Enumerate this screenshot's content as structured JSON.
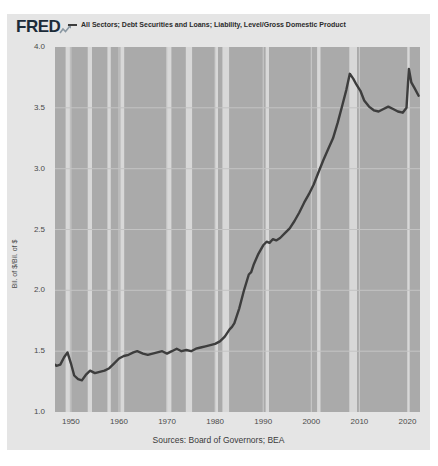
{
  "header": {
    "logo": "FRED",
    "logo_sparkline_icon": "sparkline-arrow-icon",
    "legend_marker": "line-swatch",
    "series_label": "All Sectors; Debt Securities and Loans; Liability, Level/Gross Domestic Product"
  },
  "footer": {
    "source": "Sources: Board of Governors; BEA"
  },
  "chart_data": {
    "type": "line",
    "title": "All Sectors; Debt Securities and Loans; Liability, Level/Gross Domestic Product",
    "xlabel": "",
    "ylabel": "Bil. of $/Bil. of $",
    "x_domain": [
      1946.7,
      2022.6
    ],
    "ylim": [
      1.0,
      4.0
    ],
    "x_ticks": [
      1950,
      1960,
      1970,
      1980,
      1990,
      2000,
      2010,
      2020
    ],
    "y_ticks": [
      4.0,
      3.5,
      3.0,
      2.5,
      2.0,
      1.5,
      1.0
    ],
    "y_gridlines": [
      1.5,
      2.0,
      2.5,
      3.0,
      3.5
    ],
    "grid": true,
    "legend_position": "top-header",
    "recessions": [
      [
        1948.9,
        1949.8
      ],
      [
        1953.5,
        1954.4
      ],
      [
        1957.6,
        1958.3
      ],
      [
        1960.3,
        1961.1
      ],
      [
        1969.9,
        1970.9
      ],
      [
        1973.9,
        1975.2
      ],
      [
        1980.0,
        1980.6
      ],
      [
        1981.5,
        1982.9
      ],
      [
        1990.5,
        1991.2
      ],
      [
        2001.2,
        2001.9
      ],
      [
        2007.9,
        2009.5
      ],
      [
        2020.1,
        2020.45
      ]
    ],
    "series": [
      {
        "name": "All Sectors; Debt Securities and Loans; Liability, Level/Gross Domestic Product",
        "points": [
          [
            1946.0,
            1.41
          ],
          [
            1947.0,
            1.38
          ],
          [
            1947.8,
            1.39
          ],
          [
            1948.6,
            1.45
          ],
          [
            1949.3,
            1.49
          ],
          [
            1950.0,
            1.4
          ],
          [
            1950.7,
            1.3
          ],
          [
            1951.5,
            1.27
          ],
          [
            1952.3,
            1.26
          ],
          [
            1953.2,
            1.31
          ],
          [
            1954.0,
            1.34
          ],
          [
            1955.0,
            1.32
          ],
          [
            1956.0,
            1.33
          ],
          [
            1957.0,
            1.34
          ],
          [
            1958.0,
            1.36
          ],
          [
            1959.0,
            1.4
          ],
          [
            1960.0,
            1.44
          ],
          [
            1961.0,
            1.46
          ],
          [
            1962.0,
            1.47
          ],
          [
            1963.0,
            1.49
          ],
          [
            1963.8,
            1.5
          ],
          [
            1965.0,
            1.48
          ],
          [
            1966.0,
            1.47
          ],
          [
            1967.0,
            1.48
          ],
          [
            1968.0,
            1.49
          ],
          [
            1969.0,
            1.5
          ],
          [
            1970.0,
            1.48
          ],
          [
            1971.0,
            1.5
          ],
          [
            1972.0,
            1.52
          ],
          [
            1973.0,
            1.5
          ],
          [
            1974.0,
            1.51
          ],
          [
            1975.0,
            1.5
          ],
          [
            1976.0,
            1.52
          ],
          [
            1977.0,
            1.53
          ],
          [
            1978.0,
            1.54
          ],
          [
            1979.0,
            1.55
          ],
          [
            1980.0,
            1.56
          ],
          [
            1981.0,
            1.58
          ],
          [
            1982.0,
            1.62
          ],
          [
            1983.0,
            1.68
          ],
          [
            1983.5,
            1.7
          ],
          [
            1984.0,
            1.73
          ],
          [
            1985.0,
            1.85
          ],
          [
            1986.0,
            2.0
          ],
          [
            1987.0,
            2.13
          ],
          [
            1987.5,
            2.15
          ],
          [
            1988.0,
            2.21
          ],
          [
            1989.0,
            2.3
          ],
          [
            1990.0,
            2.37
          ],
          [
            1990.7,
            2.4
          ],
          [
            1991.3,
            2.39
          ],
          [
            1992.0,
            2.42
          ],
          [
            1992.7,
            2.41
          ],
          [
            1993.5,
            2.43
          ],
          [
            1994.5,
            2.47
          ],
          [
            1995.5,
            2.51
          ],
          [
            1996.5,
            2.57
          ],
          [
            1997.5,
            2.64
          ],
          [
            1998.5,
            2.72
          ],
          [
            1999.5,
            2.79
          ],
          [
            2000.5,
            2.87
          ],
          [
            2001.5,
            2.97
          ],
          [
            2002.5,
            3.07
          ],
          [
            2003.5,
            3.16
          ],
          [
            2004.5,
            3.25
          ],
          [
            2005.5,
            3.38
          ],
          [
            2006.5,
            3.53
          ],
          [
            2007.3,
            3.65
          ],
          [
            2008.0,
            3.78
          ],
          [
            2008.7,
            3.74
          ],
          [
            2009.4,
            3.69
          ],
          [
            2010.2,
            3.64
          ],
          [
            2011.0,
            3.56
          ],
          [
            2012.0,
            3.51
          ],
          [
            2013.0,
            3.48
          ],
          [
            2014.0,
            3.47
          ],
          [
            2015.0,
            3.49
          ],
          [
            2016.0,
            3.51
          ],
          [
            2017.0,
            3.49
          ],
          [
            2018.0,
            3.47
          ],
          [
            2019.0,
            3.46
          ],
          [
            2019.8,
            3.5
          ],
          [
            2020.3,
            3.82
          ],
          [
            2020.8,
            3.71
          ],
          [
            2021.5,
            3.66
          ],
          [
            2022.3,
            3.6
          ]
        ]
      }
    ],
    "colors": {
      "card_background": "#e5e5e5",
      "plot_background": "#aaaaaa",
      "recession_band": "#d8d8d8",
      "vertical_gridline": "#cccccc",
      "horizontal_gridline": "#c4c4c4",
      "line": "#3d3d3d",
      "tick_text": "#4a4a4a",
      "logo_text": "#1c2b39",
      "logo_icon": "#8a98a3"
    }
  }
}
